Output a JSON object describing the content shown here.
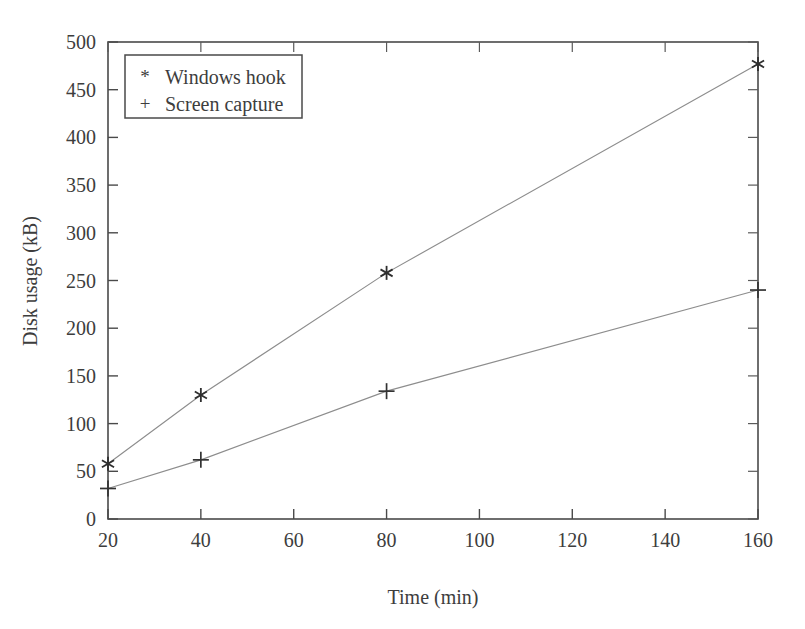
{
  "chart_data": {
    "type": "line",
    "title": "",
    "subtitle": "",
    "xlabel": "Time (min)",
    "ylabel": "Disk usage (kB)",
    "xlim": [
      20,
      160
    ],
    "ylim": [
      0,
      500
    ],
    "xticks": [
      20,
      40,
      60,
      80,
      100,
      120,
      140,
      160
    ],
    "xticklabels": [
      "20",
      "40",
      "60",
      "80",
      "100",
      "120",
      "140",
      "160"
    ],
    "yticks": [
      0,
      50,
      100,
      150,
      200,
      250,
      300,
      350,
      400,
      450,
      500
    ],
    "yticklabels": [
      "0",
      "50",
      "100",
      "150",
      "200",
      "250",
      "300",
      "350",
      "400",
      "450",
      "500"
    ],
    "grid": false,
    "legend_position": "upper-left",
    "frame": "box",
    "x": [
      20,
      40,
      80,
      160
    ],
    "series": [
      {
        "name": "Windows hook",
        "marker": "*",
        "x": [
          20,
          40,
          80,
          160
        ],
        "values": [
          58,
          130,
          258,
          477
        ]
      },
      {
        "name": "Screen capture",
        "marker": "+",
        "x": [
          20,
          40,
          80,
          160
        ],
        "values": [
          32,
          62,
          134,
          240
        ]
      }
    ],
    "annotations": []
  },
  "legend": {
    "entries": [
      {
        "symbol": "*",
        "label": "Windows hook"
      },
      {
        "symbol": "+",
        "label": "Screen capture"
      }
    ]
  },
  "colors": {
    "ink": "#3d3d3d",
    "axis": "#4a4a4a",
    "line": "#8d8d8d",
    "marker": "#2e2e2e",
    "background": "#ffffff"
  }
}
